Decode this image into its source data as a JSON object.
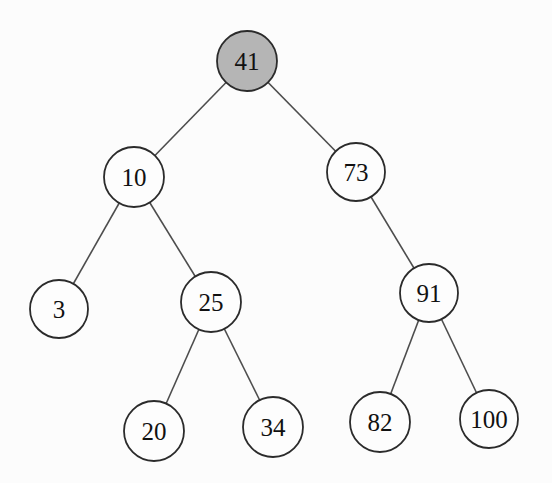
{
  "diagram": {
    "type": "binary-search-tree",
    "background": "#fcfcfc",
    "edge_color": "#4d4d4d",
    "node_stroke": "#2b2b2b",
    "node_fill": "#fdfdfd",
    "highlight_fill": "#b5b5b5",
    "text_color": "#111111",
    "nodes": [
      {
        "id": "41",
        "label": "41",
        "x": 247,
        "y": 61,
        "r": 30,
        "highlighted": true
      },
      {
        "id": "10",
        "label": "10",
        "x": 134,
        "y": 177,
        "r": 30,
        "highlighted": false
      },
      {
        "id": "73",
        "label": "73",
        "x": 356,
        "y": 172,
        "r": 29,
        "highlighted": false
      },
      {
        "id": "3",
        "label": "3",
        "x": 59,
        "y": 309,
        "r": 29,
        "highlighted": false
      },
      {
        "id": "25",
        "label": "25",
        "x": 211,
        "y": 302,
        "r": 30,
        "highlighted": false
      },
      {
        "id": "91",
        "label": "91",
        "x": 429,
        "y": 293,
        "r": 29,
        "highlighted": false
      },
      {
        "id": "20",
        "label": "20",
        "x": 154,
        "y": 431,
        "r": 30,
        "highlighted": false
      },
      {
        "id": "34",
        "label": "34",
        "x": 273,
        "y": 427,
        "r": 30,
        "highlighted": false
      },
      {
        "id": "82",
        "label": "82",
        "x": 380,
        "y": 422,
        "r": 30,
        "highlighted": false
      },
      {
        "id": "100",
        "label": "100",
        "x": 489,
        "y": 419,
        "r": 29,
        "highlighted": false
      }
    ],
    "edges": [
      {
        "from": "41",
        "to": "10"
      },
      {
        "from": "41",
        "to": "73"
      },
      {
        "from": "10",
        "to": "3"
      },
      {
        "from": "10",
        "to": "25"
      },
      {
        "from": "25",
        "to": "20"
      },
      {
        "from": "25",
        "to": "34"
      },
      {
        "from": "73",
        "to": "91"
      },
      {
        "from": "91",
        "to": "82"
      },
      {
        "from": "91",
        "to": "100"
      }
    ]
  }
}
